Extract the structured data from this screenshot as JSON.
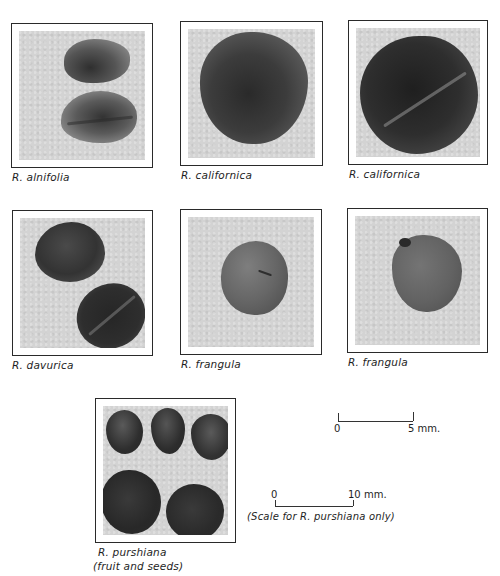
{
  "plates": [
    {
      "id": "alnifolia",
      "caption": "R. alnifolia"
    },
    {
      "id": "californica-1",
      "caption": "R. californica"
    },
    {
      "id": "californica-2",
      "caption": "R. californica"
    },
    {
      "id": "davurica",
      "caption": "R. davurica"
    },
    {
      "id": "frangula-1",
      "caption": "R. frangula"
    },
    {
      "id": "frangula-2",
      "caption": "R. frangula"
    },
    {
      "id": "purshiana",
      "caption": "R. purshiana",
      "caption_line2": "(fruit and seeds)"
    }
  ],
  "scale_5mm": {
    "zero": "0",
    "end": "5 mm."
  },
  "scale_10mm": {
    "zero": "0",
    "end": "10 mm.",
    "note": "(Scale for R. purshiana only)"
  },
  "colors": {
    "background": "#ffffff",
    "photo": "#d3d3d3",
    "seed_dark": "#3a3a3a",
    "seed_mid": "#6e6e6e",
    "border": "#2a2a2a"
  }
}
